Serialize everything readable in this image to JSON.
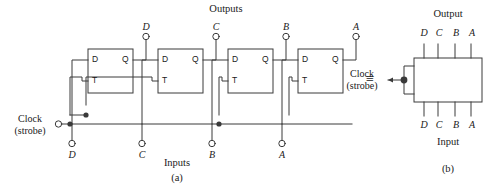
{
  "figure": {
    "title_a": "(a)",
    "title_b": "(b)",
    "equivalence_symbol": "≡"
  },
  "diagram_a": {
    "outputs_label": "Outputs",
    "inputs_label": "Inputs",
    "clock_label_line1": "Clock",
    "clock_label_line2": "(strobe)",
    "stages": [
      {
        "name": "flipflop-d",
        "output_terminal": "D",
        "input_terminal": "D",
        "pin_d": "D",
        "pin_q": "Q",
        "pin_t": "T"
      },
      {
        "name": "flipflop-c",
        "output_terminal": "C",
        "input_terminal": "C",
        "pin_d": "D",
        "pin_q": "Q",
        "pin_t": "T"
      },
      {
        "name": "flipflop-b",
        "output_terminal": "B",
        "input_terminal": "B",
        "pin_d": "D",
        "pin_q": "Q",
        "pin_t": "T"
      },
      {
        "name": "flipflop-a",
        "output_terminal": "A",
        "input_terminal": "A",
        "pin_d": "D",
        "pin_q": "Q",
        "pin_t": "T"
      }
    ]
  },
  "diagram_b": {
    "output_label": "Output",
    "input_label": "Input",
    "clock_label_line1": "Clock",
    "clock_label_line2": "(strobe)",
    "output_pins": [
      "D",
      "C",
      "B",
      "A"
    ],
    "input_pins": [
      "D",
      "C",
      "B",
      "A"
    ]
  },
  "colors": {
    "line": "#3a3a3a",
    "text": "#1a1a1a",
    "background": "#ffffff"
  }
}
